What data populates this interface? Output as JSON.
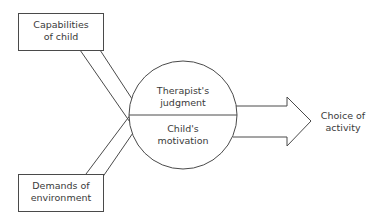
{
  "nodes": {
    "capabilities": {
      "line1": "Capabilities",
      "line2": "of child"
    },
    "demands": {
      "line1": "Demands of",
      "line2": "environment"
    },
    "circle_top": {
      "line1": "Therapist's",
      "line2": "judgment"
    },
    "circle_bottom": {
      "line1": "Child's",
      "line2": "motivation"
    },
    "output": {
      "line1": "Choice of",
      "line2": "activity"
    }
  },
  "colors": {
    "stroke": "#4a4a4a",
    "background": "#ffffff"
  }
}
